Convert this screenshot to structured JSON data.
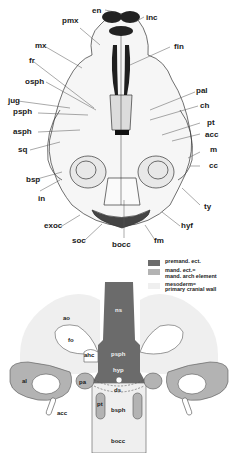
{
  "figure": {
    "top_panel": {
      "description": "ventral view of skull, line drawing",
      "labels_left": [
        {
          "id": "pmx",
          "text": "pmx"
        },
        {
          "id": "mx",
          "text": "mx"
        },
        {
          "id": "fr",
          "text": "fr"
        },
        {
          "id": "osph",
          "text": "osph"
        },
        {
          "id": "jug",
          "text": "jug"
        },
        {
          "id": "psph",
          "text": "psph"
        },
        {
          "id": "asph",
          "text": "asph"
        },
        {
          "id": "sq",
          "text": "sq"
        },
        {
          "id": "bsp",
          "text": "bsp"
        },
        {
          "id": "in",
          "text": "in"
        },
        {
          "id": "exoc",
          "text": "exoc"
        },
        {
          "id": "soc",
          "text": "soc"
        }
      ],
      "labels_right": [
        {
          "id": "en",
          "text": "en"
        },
        {
          "id": "inc",
          "text": "inc"
        },
        {
          "id": "fin",
          "text": "fin"
        },
        {
          "id": "pal",
          "text": "pal"
        },
        {
          "id": "ch",
          "text": "ch"
        },
        {
          "id": "pt",
          "text": "pt"
        },
        {
          "id": "acc",
          "text": "acc"
        },
        {
          "id": "m",
          "text": "m"
        },
        {
          "id": "cc",
          "text": "cc"
        },
        {
          "id": "ty",
          "text": "ty"
        },
        {
          "id": "hyf",
          "text": "hyf"
        },
        {
          "id": "fm",
          "text": "fm"
        },
        {
          "id": "bocc",
          "text": "bocc"
        }
      ]
    },
    "legend": {
      "items": [
        {
          "label": "premand. ect.",
          "color": "#6b6b6b"
        },
        {
          "label": "mand. ect.=\nmand. arch element",
          "color": "#b3b3b3"
        },
        {
          "label": "mesoderm=\nprimary cranial wall",
          "color": "#efefef"
        }
      ]
    },
    "bottom_panel": {
      "description": "schematic of cranial base origins",
      "labels": {
        "ns": "ns",
        "ao": "ao",
        "fo": "fo",
        "ahc": "ahc",
        "psph": "psph",
        "hyp": "hyp",
        "al": "al",
        "pa": "pa",
        "ds": "ds",
        "pt": "pt",
        "bsph": "bsph",
        "acc": "acc",
        "bocc": "bocc"
      },
      "colors": {
        "dark": "#6b6b6b",
        "medium": "#b3b3b3",
        "light": "#efefef",
        "outline": "#555555"
      }
    }
  }
}
